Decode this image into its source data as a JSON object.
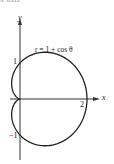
{
  "header": {
    "cropped_text": "x-axis"
  },
  "chart_data": {
    "type": "line",
    "subtype": "polar-curve",
    "title": "",
    "equation_label": "r = 1 + cos θ",
    "xlabel": "x",
    "ylabel": "y",
    "tick_labels": {
      "x": [
        "2"
      ],
      "y": [
        "1",
        "-1"
      ]
    },
    "xlim": [
      -0.6,
      2.4
    ],
    "ylim": [
      -1.8,
      2.7
    ],
    "grid": false,
    "legend": "none",
    "series": [
      {
        "name": "r = 1 + cos θ",
        "kind": "cardioid",
        "a": 1,
        "theta_range": [
          0,
          6.2832
        ],
        "key_points": [
          {
            "x": 2,
            "y": 0
          },
          {
            "x": 0,
            "y": 1
          },
          {
            "x": 0,
            "y": 0
          },
          {
            "x": 0,
            "y": -1
          }
        ]
      }
    ]
  },
  "labels": {
    "y_axis": "y",
    "x_axis": "x",
    "equation": "r = 1 + cos θ",
    "tick_x_2": "2",
    "tick_y_1": "1",
    "tick_y_neg1": "−1"
  }
}
